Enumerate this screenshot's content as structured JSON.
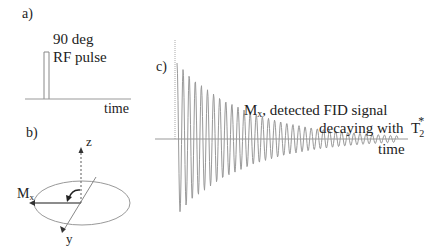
{
  "panel_a": {
    "label": "a)",
    "pulse_label_line1": "90 deg",
    "pulse_label_line2": "RF pulse",
    "axis_label": "time"
  },
  "panel_b": {
    "label": "b)",
    "z_axis": "z",
    "y_axis": "y",
    "magnetization_main": "M",
    "magnetization_sub": "x"
  },
  "panel_c": {
    "label": "c)",
    "caption_line1_main": "M",
    "caption_line1_sub": "x",
    "caption_line1_rest": ", detected FID signal",
    "caption_line2": "decaying with",
    "t2_main": "T",
    "t2_sub": "2",
    "t2_sup": "*",
    "axis_label": "time"
  },
  "colors": {
    "line": "#888888",
    "text": "#222222",
    "axis": "#999999"
  }
}
